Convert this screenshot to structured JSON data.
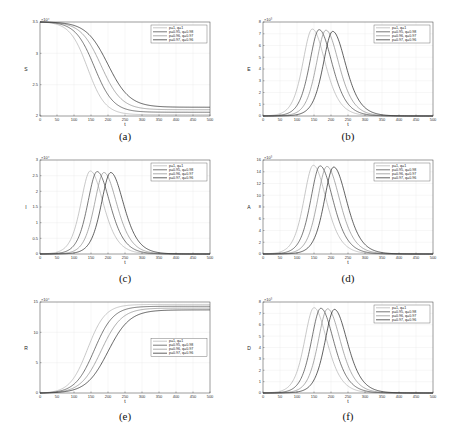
{
  "chart_data": [
    {
      "id": "a",
      "type": "line",
      "caption": "(a)",
      "xlabel": "t",
      "ylabel": "S",
      "exponent": "×10⁴",
      "xlim": [
        0,
        500
      ],
      "ylim": [
        2,
        3.5
      ],
      "xticks": [
        0,
        50,
        100,
        150,
        200,
        250,
        300,
        350,
        400,
        450,
        500
      ],
      "yticks": [
        2,
        2.5,
        3,
        3.5
      ],
      "grid": true,
      "legend_position": "top-right",
      "shape": "decay",
      "series": [
        {
          "name": "p=1, q=1",
          "start": 3.5,
          "end": 2.02,
          "mid": 140,
          "width": 26
        },
        {
          "name": "p=0.95, q=0.98",
          "start": 3.5,
          "end": 2.06,
          "mid": 160,
          "width": 28
        },
        {
          "name": "p=0.96, q=0.97",
          "start": 3.5,
          "end": 2.1,
          "mid": 180,
          "width": 30
        },
        {
          "name": "p=0.97, q=0.96",
          "start": 3.5,
          "end": 2.14,
          "mid": 200,
          "width": 32
        }
      ]
    },
    {
      "id": "b",
      "type": "line",
      "caption": "(b)",
      "xlabel": "t",
      "ylabel": "E",
      "exponent": "×10³",
      "xlim": [
        0,
        500
      ],
      "ylim": [
        0,
        8
      ],
      "xticks": [
        0,
        50,
        100,
        150,
        200,
        250,
        300,
        350,
        400,
        450,
        500
      ],
      "yticks": [
        0,
        1,
        2,
        3,
        4,
        5,
        6,
        7,
        8
      ],
      "grid": true,
      "legend_position": "top-right",
      "shape": "peak",
      "series": [
        {
          "name": "p=1, q=1",
          "peak": 7.4,
          "at": 145
        },
        {
          "name": "p=0.95, q=0.98",
          "peak": 7.35,
          "at": 165
        },
        {
          "name": "p=0.96, q=0.97",
          "peak": 7.3,
          "at": 185
        },
        {
          "name": "p=0.97, q=0.96",
          "peak": 7.2,
          "at": 205
        }
      ]
    },
    {
      "id": "c",
      "type": "line",
      "caption": "(c)",
      "xlabel": "t",
      "ylabel": "I",
      "exponent": "×10⁴",
      "xlim": [
        0,
        500
      ],
      "ylim": [
        0,
        3
      ],
      "xticks": [
        0,
        50,
        100,
        150,
        200,
        250,
        300,
        350,
        400,
        450,
        500
      ],
      "yticks": [
        0,
        0.5,
        1,
        1.5,
        2,
        2.5,
        3
      ],
      "grid": true,
      "legend_position": "top-right",
      "shape": "peak",
      "series": [
        {
          "name": "p=1, q=1",
          "peak": 2.65,
          "at": 148
        },
        {
          "name": "p=0.95, q=0.98",
          "peak": 2.63,
          "at": 168
        },
        {
          "name": "p=0.96, q=0.97",
          "peak": 2.6,
          "at": 188
        },
        {
          "name": "p=0.97, q=0.96",
          "peak": 2.6,
          "at": 208
        }
      ]
    },
    {
      "id": "d",
      "type": "line",
      "caption": "(d)",
      "xlabel": "t",
      "ylabel": "A",
      "exponent": "×10³",
      "xlim": [
        0,
        500
      ],
      "ylim": [
        0,
        16
      ],
      "xticks": [
        0,
        50,
        100,
        150,
        200,
        250,
        300,
        350,
        400,
        450,
        500
      ],
      "yticks": [
        0,
        2,
        4,
        6,
        8,
        10,
        12,
        14,
        16
      ],
      "grid": true,
      "legend_position": "top-right",
      "shape": "peak",
      "series": [
        {
          "name": "p=1, q=1",
          "peak": 15.1,
          "at": 148
        },
        {
          "name": "p=0.95, q=0.98",
          "peak": 15.0,
          "at": 168
        },
        {
          "name": "p=0.96, q=0.97",
          "peak": 14.9,
          "at": 188
        },
        {
          "name": "p=0.97, q=0.96",
          "peak": 14.8,
          "at": 208
        }
      ]
    },
    {
      "id": "e",
      "type": "line",
      "caption": "(e)",
      "xlabel": "t",
      "ylabel": "R",
      "exponent": "×10⁴",
      "xlim": [
        0,
        500
      ],
      "ylim": [
        0,
        15
      ],
      "xticks": [
        0,
        50,
        100,
        150,
        200,
        250,
        300,
        350,
        400,
        450,
        500
      ],
      "yticks": [
        0,
        5,
        10,
        15
      ],
      "grid": true,
      "legend_position": "center-right",
      "shape": "growth",
      "series": [
        {
          "name": "p=1, q=1",
          "start": 0,
          "end": 14.6,
          "mid": 140,
          "width": 26
        },
        {
          "name": "p=0.95, q=0.98",
          "start": 0,
          "end": 14.3,
          "mid": 160,
          "width": 28
        },
        {
          "name": "p=0.96, q=0.97",
          "start": 0,
          "end": 14.0,
          "mid": 180,
          "width": 30
        },
        {
          "name": "p=0.97, q=0.96",
          "start": 0,
          "end": 13.7,
          "mid": 200,
          "width": 32
        }
      ]
    },
    {
      "id": "f",
      "type": "line",
      "caption": "(f)",
      "xlabel": "t",
      "ylabel": "D",
      "exponent": "×10³",
      "xlim": [
        0,
        500
      ],
      "ylim": [
        0,
        8
      ],
      "xticks": [
        0,
        50,
        100,
        150,
        200,
        250,
        300,
        350,
        400,
        450,
        500
      ],
      "yticks": [
        0,
        1,
        2,
        3,
        4,
        5,
        6,
        7,
        8
      ],
      "grid": true,
      "legend_position": "top-right",
      "shape": "peak",
      "series": [
        {
          "name": "p=1, q=1",
          "peak": 7.5,
          "at": 150
        },
        {
          "name": "p=0.95, q=0.98",
          "peak": 7.45,
          "at": 170
        },
        {
          "name": "p=0.96, q=0.97",
          "peak": 7.4,
          "at": 190
        },
        {
          "name": "p=0.97, q=0.96",
          "peak": 7.35,
          "at": 210
        }
      ]
    }
  ],
  "series_colors": [
    "#b0b0b0",
    "#404040",
    "#8a8a8a",
    "#1e1e1e"
  ]
}
